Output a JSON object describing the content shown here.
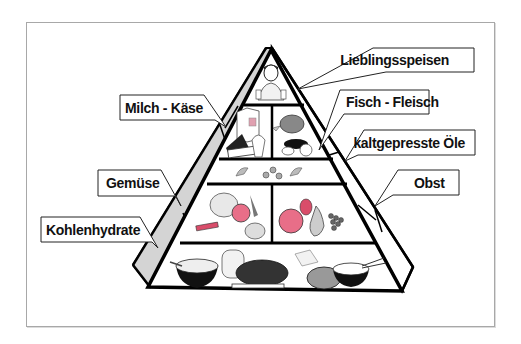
{
  "diagram": {
    "type": "food-pyramid",
    "language": "de",
    "colors": {
      "outline": "#000000",
      "side_face": "#d4d4d4",
      "label_box_fill": "#ffffff",
      "label_box_border": "#222222",
      "accent_red": "#e0607a",
      "frame": "#a8a8a8"
    },
    "tiers": [
      {
        "level": 1,
        "position": "top",
        "compartments": [
          {
            "content": "person-with-sweets-icon"
          }
        ]
      },
      {
        "level": 2,
        "compartments": [
          {
            "content": "dairy-icon",
            "label": "Milch - Käse"
          },
          {
            "content": "fish-meat-icon",
            "label": "Fisch - Fleisch"
          }
        ]
      },
      {
        "level": 3,
        "compartments": [
          {
            "content": "oil-drops-icon",
            "label": "kaltgepresste Öle"
          }
        ]
      },
      {
        "level": 4,
        "compartments": [
          {
            "content": "vegetables-icon",
            "label": "Gemüse"
          },
          {
            "content": "fruit-icon",
            "label": "Obst"
          }
        ]
      },
      {
        "level": 5,
        "position": "base",
        "compartments": [
          {
            "content": "carbohydrates-icon",
            "label": "Kohlenhydrate"
          }
        ]
      }
    ],
    "labels": {
      "top": "Lieblingsspeisen",
      "dairy": "Milch - Käse",
      "fish_meat": "Fisch - Fleisch",
      "oils": "kaltgepresste Öle",
      "vegetables": "Gemüse",
      "fruit": "Obst",
      "carbs": "Kohlenhydrate"
    }
  }
}
